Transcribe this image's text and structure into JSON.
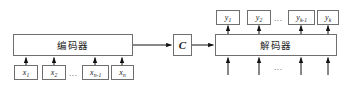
{
  "diagram": {
    "title_text": "",
    "colors": {
      "stroke": "#6f6f6f",
      "arrow": "#111111",
      "text": "#1a1a1a",
      "background": "#ffffff"
    },
    "encoder": {
      "label": "编码器",
      "name": "encoder"
    },
    "decoder": {
      "label": "解码器",
      "name": "decoder"
    },
    "code": {
      "label": "C",
      "name": "code-vector"
    },
    "inputs": {
      "ellipsis": "...",
      "items": [
        {
          "base": "x",
          "sub": "1"
        },
        {
          "base": "x",
          "sub": "2"
        },
        {
          "base": "x",
          "sub": "n-1"
        },
        {
          "base": "x",
          "sub": "n"
        }
      ],
      "labels": [
        "x1",
        "x2",
        "xn-1",
        "xn"
      ]
    },
    "outputs": {
      "ellipsis": "...",
      "items": [
        {
          "base": "y",
          "sub": "1"
        },
        {
          "base": "y",
          "sub": "2"
        },
        {
          "base": "y",
          "sub": "k-1"
        },
        {
          "base": "y",
          "sub": "k"
        }
      ],
      "labels": [
        "y1",
        "y2",
        "yk-1",
        "yk"
      ]
    },
    "decoder_feed": {
      "ellipsis": "...",
      "arrow_count": 4
    }
  }
}
